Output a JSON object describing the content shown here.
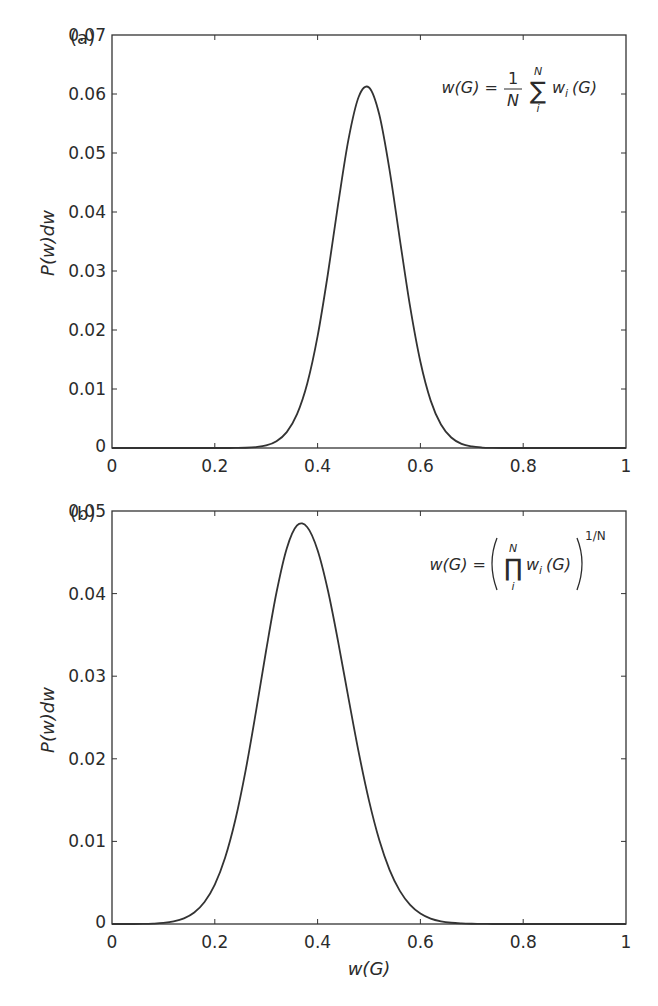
{
  "figure": {
    "xlabel": "w(G)",
    "line_color": "#333333",
    "axis_color": "#333333"
  },
  "panels": [
    {
      "panel_label": "(a)",
      "ylabel": "P(w)dw",
      "formula": {
        "lhs": "w(G) =",
        "fraction_num": "1",
        "fraction_den": "N",
        "operator": "∑",
        "upper": "N",
        "lower": "i",
        "term": "w",
        "term_sub": "i",
        "term_arg": "(G)"
      },
      "x_ticks": [
        "0",
        "0.2",
        "0.4",
        "0.6",
        "0.8",
        "1"
      ],
      "y_ticks": [
        "0",
        "0.01",
        "0.02",
        "0.03",
        "0.04",
        "0.05",
        "0.06",
        "0.07"
      ]
    },
    {
      "panel_label": "(b)",
      "ylabel": "P(w)dw",
      "formula": {
        "lhs": "w(G) =",
        "operator": "∏",
        "upper": "N",
        "lower": "i",
        "term": "w",
        "term_sub": "i",
        "term_arg": "(G)",
        "exponent": "1/N"
      },
      "x_ticks": [
        "0",
        "0.2",
        "0.4",
        "0.6",
        "0.8",
        "1"
      ],
      "y_ticks": [
        "0",
        "0.01",
        "0.02",
        "0.03",
        "0.04",
        "0.05"
      ]
    }
  ],
  "chart_data": [
    {
      "type": "line",
      "title": "(a) w(G) = (1/N) Σ_i^N w_i(G)",
      "xlabel": "",
      "ylabel": "P(w)dw",
      "xlim": [
        0,
        1
      ],
      "ylim": [
        0,
        0.07
      ],
      "grid": false,
      "legend": "none",
      "annotation": "w(G) = 1/N Σ_i^N w_i(G)",
      "x": [
        0.0,
        0.02,
        0.04,
        0.06,
        0.08,
        0.1,
        0.12,
        0.14,
        0.16,
        0.18,
        0.2,
        0.22,
        0.24,
        0.26,
        0.28,
        0.3,
        0.32,
        0.34,
        0.36,
        0.38,
        0.4,
        0.42,
        0.44,
        0.46,
        0.48,
        0.5,
        0.52,
        0.54,
        0.56,
        0.58,
        0.6,
        0.62,
        0.64,
        0.66,
        0.68,
        0.7,
        0.72,
        0.74,
        0.76,
        0.78,
        0.8,
        0.82,
        0.84,
        0.86,
        0.88,
        0.9,
        0.92,
        0.94,
        0.96,
        0.98,
        1.0
      ],
      "series": [
        {
          "name": "arithmetic mean",
          "values": [
            0,
            0,
            0,
            0,
            0,
            0,
            0,
            0,
            0,
            0,
            0,
            0,
            1e-05,
            4e-05,
            0.00015,
            0.00043,
            0.00115,
            0.00269,
            0.00573,
            0.01097,
            0.01895,
            0.02949,
            0.04136,
            0.05227,
            0.05953,
            0.0611,
            0.05651,
            0.04711,
            0.03538,
            0.02395,
            0.01461,
            0.00803,
            0.00398,
            0.00178,
            0.00071,
            0.00026,
            8e-05,
            2e-05,
            0,
            0,
            0,
            0,
            0,
            0,
            0,
            0,
            0,
            0,
            0,
            0,
            0
          ]
        }
      ]
    },
    {
      "type": "line",
      "title": "(b) w(G) = (Π_i^N w_i(G))^(1/N)",
      "xlabel": "w(G)",
      "ylabel": "P(w)dw",
      "xlim": [
        0,
        1
      ],
      "ylim": [
        0,
        0.05
      ],
      "grid": false,
      "legend": "none",
      "annotation": "w(G) = (Π_i^N w_i(G))^(1/N)",
      "x": [
        0.0,
        0.02,
        0.04,
        0.06,
        0.08,
        0.1,
        0.12,
        0.14,
        0.16,
        0.18,
        0.2,
        0.22,
        0.24,
        0.26,
        0.28,
        0.3,
        0.32,
        0.34,
        0.36,
        0.38,
        0.4,
        0.42,
        0.44,
        0.46,
        0.48,
        0.5,
        0.52,
        0.54,
        0.56,
        0.58,
        0.6,
        0.62,
        0.64,
        0.66,
        0.68,
        0.7,
        0.72,
        0.74,
        0.76,
        0.78,
        0.8,
        0.82,
        0.84,
        0.86,
        0.88,
        0.9,
        0.92,
        0.94,
        0.96,
        0.98,
        1.0
      ],
      "series": [
        {
          "name": "geometric mean",
          "values": [
            0,
            0,
            0,
            1e-05,
            5e-05,
            0.00013,
            0.00031,
            0.00068,
            0.00139,
            0.00266,
            0.00477,
            0.00802,
            0.01262,
            0.0186,
            0.02567,
            0.03317,
            0.04013,
            0.04547,
            0.04825,
            0.04803,
            0.04525,
            0.0404,
            0.03416,
            0.02737,
            0.02077,
            0.01494,
            0.01017,
            0.00656,
            0.00401,
            0.00232,
            0.00127,
            0.00066,
            0.00033,
            0.00015,
            7e-05,
            3e-05,
            1e-05,
            0,
            0,
            0,
            0,
            0,
            0,
            0,
            0,
            0,
            0,
            0,
            0,
            0,
            0
          ]
        }
      ]
    }
  ]
}
